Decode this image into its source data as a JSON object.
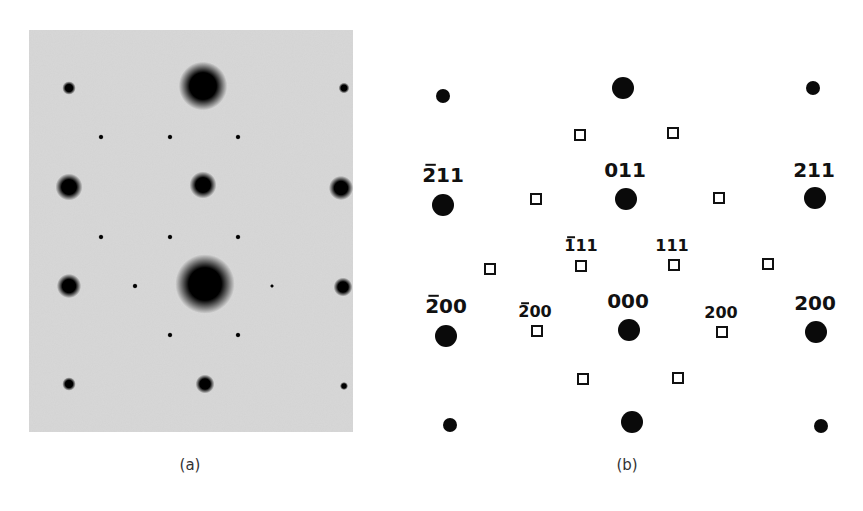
{
  "figure": {
    "captions": {
      "a": "(a)",
      "b": "(b)"
    },
    "colors": {
      "photo_bg": "#d8d8d8",
      "spot": "#0a0a0a",
      "background": "#ffffff"
    }
  },
  "panel_a": {
    "type": "electron diffraction photograph",
    "spots": [
      {
        "x": 40,
        "y": 58,
        "r": 5
      },
      {
        "x": 174,
        "y": 56,
        "r": 18
      },
      {
        "x": 315,
        "y": 58,
        "r": 4
      },
      {
        "x": 72,
        "y": 107,
        "r": 2
      },
      {
        "x": 141,
        "y": 107,
        "r": 2
      },
      {
        "x": 209,
        "y": 107,
        "r": 2
      },
      {
        "x": 40,
        "y": 157,
        "r": 10
      },
      {
        "x": 174,
        "y": 155,
        "r": 10
      },
      {
        "x": 312,
        "y": 158,
        "r": 9
      },
      {
        "x": 72,
        "y": 207,
        "r": 2
      },
      {
        "x": 141,
        "y": 207,
        "r": 2
      },
      {
        "x": 209,
        "y": 207,
        "r": 2
      },
      {
        "x": 40,
        "y": 256,
        "r": 9
      },
      {
        "x": 106,
        "y": 256,
        "r": 2
      },
      {
        "x": 176,
        "y": 254,
        "r": 22
      },
      {
        "x": 243,
        "y": 256,
        "r": 1.5
      },
      {
        "x": 314,
        "y": 257,
        "r": 7
      },
      {
        "x": 141,
        "y": 305,
        "r": 2
      },
      {
        "x": 209,
        "y": 305,
        "r": 2
      },
      {
        "x": 40,
        "y": 354,
        "r": 5
      },
      {
        "x": 176,
        "y": 354,
        "r": 7
      },
      {
        "x": 315,
        "y": 356,
        "r": 3
      }
    ]
  },
  "panel_b": {
    "type": "indexed diffraction pattern schematic",
    "circles": [
      {
        "x": 43,
        "y": 96,
        "r": 7
      },
      {
        "x": 223,
        "y": 88,
        "r": 11
      },
      {
        "x": 413,
        "y": 88,
        "r": 7
      },
      {
        "x": 43,
        "y": 205,
        "r": 11,
        "label": "2̄ 1 1",
        "lx": 43,
        "ly": 182
      },
      {
        "x": 226,
        "y": 199,
        "r": 11,
        "label": "011",
        "lx": 225,
        "ly": 177
      },
      {
        "x": 415,
        "y": 198,
        "r": 11,
        "label": "211",
        "lx": 414,
        "ly": 177
      },
      {
        "x": 46,
        "y": 336,
        "r": 11,
        "label": "2̄ 0 0",
        "lx": 46,
        "ly": 313
      },
      {
        "x": 229,
        "y": 330,
        "r": 11,
        "label": "000",
        "lx": 228,
        "ly": 308
      },
      {
        "x": 416,
        "y": 332,
        "r": 11,
        "label": "200",
        "lx": 415,
        "ly": 310
      },
      {
        "x": 50,
        "y": 425,
        "r": 7
      },
      {
        "x": 232,
        "y": 422,
        "r": 11
      },
      {
        "x": 421,
        "y": 426,
        "r": 7
      }
    ],
    "squares": [
      {
        "x": 180,
        "y": 135
      },
      {
        "x": 273,
        "y": 133
      },
      {
        "x": 136,
        "y": 199
      },
      {
        "x": 319,
        "y": 198
      },
      {
        "x": 90,
        "y": 269
      },
      {
        "x": 181,
        "y": 266,
        "label": "1̄ 1 1",
        "lx": 181,
        "ly": 249
      },
      {
        "x": 274,
        "y": 265,
        "label": "111",
        "lx": 272,
        "ly": 249
      },
      {
        "x": 368,
        "y": 264
      },
      {
        "x": 137,
        "y": 331,
        "label": "2̄ 0 0",
        "lx": 135,
        "ly": 315
      },
      {
        "x": 322,
        "y": 332,
        "label": "200",
        "lx": 321,
        "ly": 316
      },
      {
        "x": 183,
        "y": 379
      },
      {
        "x": 278,
        "y": 378
      }
    ],
    "labels": {
      "big": [
        {
          "text": "211",
          "bar": true,
          "x": 43,
          "y": 182
        },
        {
          "text": "011",
          "bar": false,
          "x": 225,
          "y": 177
        },
        {
          "text": "211",
          "bar": false,
          "x": 414,
          "y": 177
        },
        {
          "text": "200",
          "bar": true,
          "x": 46,
          "y": 313
        },
        {
          "text": "000",
          "bar": false,
          "x": 228,
          "y": 308
        },
        {
          "text": "200",
          "bar": false,
          "x": 415,
          "y": 310
        }
      ],
      "small": [
        {
          "text": "111",
          "bar": true,
          "x": 181,
          "y": 251
        },
        {
          "text": "111",
          "bar": false,
          "x": 272,
          "y": 251
        },
        {
          "text": "200",
          "bar": true,
          "x": 135,
          "y": 317
        },
        {
          "text": "200",
          "bar": false,
          "x": 321,
          "y": 318
        }
      ]
    }
  }
}
